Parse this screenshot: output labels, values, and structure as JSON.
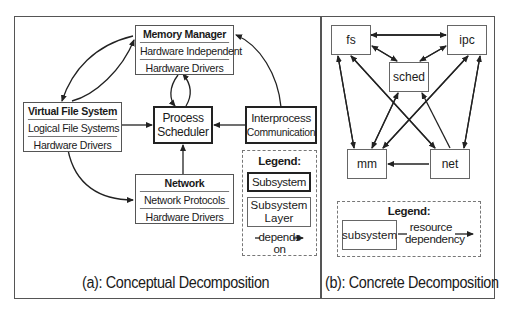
{
  "panel_a": {
    "caption": "(a): Conceptual Decomposition",
    "memory_manager": {
      "title": "Memory Manager",
      "layers": [
        "Hardware Independent",
        "Hardware Drivers"
      ]
    },
    "vfs": {
      "title": "Virtual File System",
      "layers": [
        "Logical File Systems",
        "Hardware Drivers"
      ]
    },
    "network": {
      "title": "Network",
      "layers": [
        "Network Protocols",
        "Hardware Drivers"
      ]
    },
    "process_scheduler": {
      "line1": "Process",
      "line2": "Scheduler"
    },
    "ipc": {
      "line1": "Interprocess",
      "line2": "Communication"
    },
    "legend": {
      "title": "Legend:",
      "subsystem": "Subsystem",
      "layer_line1": "Subsystem",
      "layer_line2": "Layer",
      "depends_line1": "—depends→",
      "depends_line2": "on"
    }
  },
  "panel_b": {
    "caption": "(b): Concrete Decomposition",
    "nodes": {
      "fs": "fs",
      "ipc": "ipc",
      "sched": "sched",
      "mm": "mm",
      "net": "net"
    },
    "legend": {
      "title": "Legend:",
      "subsystem": "subsystem",
      "dep_line1": "resource",
      "dep_line2": "dependency"
    }
  },
  "colors": {
    "line": "#222222",
    "frame": "#555555",
    "dashed": "#777777"
  }
}
